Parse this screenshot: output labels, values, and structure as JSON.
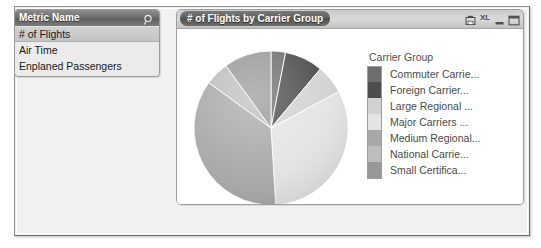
{
  "window": {
    "frame_bg": "#f1f1f1",
    "border_color": "#8f8f8f"
  },
  "metric_panel": {
    "header_title": "Metric Name",
    "search_icon": "magnifier-icon",
    "items": [
      {
        "label": "# of Flights",
        "selected": true
      },
      {
        "label": "Air Time",
        "selected": false
      },
      {
        "label": "Enplaned Passengers",
        "selected": false
      }
    ]
  },
  "chart_panel": {
    "title": "# of Flights by Carrier Group",
    "titlebar_icons": [
      {
        "name": "save-grid-icon",
        "glyph": ""
      },
      {
        "name": "export-excel-icon",
        "glyph": "XL"
      },
      {
        "name": "minimize-icon",
        "glyph": ""
      },
      {
        "name": "maximize-icon",
        "glyph": ""
      }
    ]
  },
  "chart_data": {
    "type": "pie",
    "title": "# of Flights by Carrier Group",
    "legend_title": "Carrier Group",
    "legend_position": "right",
    "grid": false,
    "categories": [
      "Commuter Carrie...",
      "Foreign Carrier...",
      "Large Regional ...",
      "Major Carriers ...",
      "Medium Regional...",
      "National Carrie...",
      "Small Certifica..."
    ],
    "values": [
      3,
      8,
      6,
      32,
      36,
      5,
      10
    ],
    "colors": [
      "#6e6e6e",
      "#4d4d4d",
      "#d2d2d2",
      "#e4e4e4",
      "#a8a8a8",
      "#bdbdbd",
      "#989898"
    ],
    "slice_angles_deg": [
      11,
      29,
      22,
      115,
      130,
      18,
      36
    ],
    "start_angle_deg": 0,
    "direction": "clockwise",
    "xlabel": "",
    "ylabel": ""
  }
}
